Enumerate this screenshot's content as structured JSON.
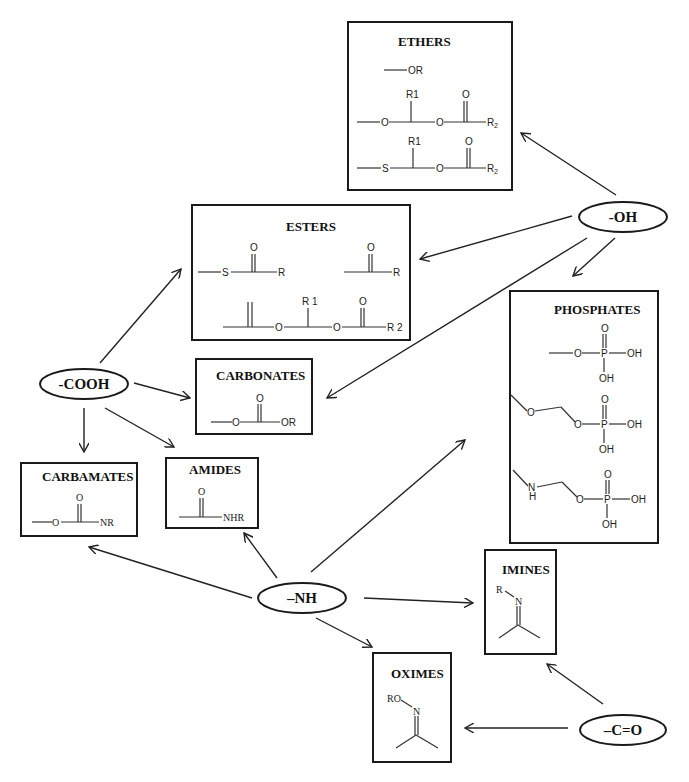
{
  "diagram": {
    "nodes": {
      "oh": {
        "label": "-OH"
      },
      "cooh": {
        "label": "-COOH"
      },
      "nh": {
        "label": "–NH"
      },
      "co": {
        "label": "–C=O"
      }
    },
    "groups": {
      "ethers": {
        "title": "ETHERS",
        "s1": {
          "or": "OR"
        },
        "s2": {
          "r1": "R1",
          "o1": "O",
          "o2": "O",
          "o3": "O",
          "r2": "R",
          "r2sub": "2"
        },
        "s3": {
          "r1": "R1",
          "s": "S",
          "o2": "O",
          "o3": "O",
          "r2": "R",
          "r2sub": "2"
        }
      },
      "esters": {
        "title": "ESTERS",
        "s1": {
          "s": "S",
          "o": "O",
          "r": "R"
        },
        "s2": {
          "o": "O",
          "r": "R"
        },
        "s3": {
          "r1": "R 1",
          "o1": "O",
          "o2": "O",
          "o3": "O",
          "r2": "R 2"
        }
      },
      "phosphates": {
        "title": "PHOSPHATES",
        "s1": {
          "o": "O",
          "p": "P",
          "od": "O",
          "oh1": "OH",
          "oh2": "OH"
        },
        "s2": {
          "o0": "O",
          "o": "O",
          "p": "P",
          "od": "O",
          "oh1": "OH",
          "oh2": "OH"
        },
        "s3": {
          "n": "N",
          "h": "H",
          "o": "O",
          "p": "P",
          "od": "O",
          "oh1": "OH",
          "oh2": "OH"
        }
      },
      "carbonates": {
        "title": "CARBONATES",
        "s1": {
          "o1": "O",
          "od": "O",
          "or": "OR"
        }
      },
      "carbamates": {
        "title": "CARBAMATES",
        "s1": {
          "o1": "O",
          "od": "O",
          "nr": "NR"
        }
      },
      "amides": {
        "title": "AMIDES",
        "s1": {
          "od": "O",
          "nhr": "NHR"
        }
      },
      "imines": {
        "title": "IMINES",
        "s1": {
          "r": "R",
          "n": "N"
        }
      },
      "oximes": {
        "title": "OXIMES",
        "s1": {
          "ro": "RO",
          "n": "N"
        }
      }
    },
    "edges": [
      {
        "from": "-OH",
        "to": "ETHERS"
      },
      {
        "from": "-OH",
        "to": "ESTERS"
      },
      {
        "from": "-OH",
        "to": "CARBONATES"
      },
      {
        "from": "-OH",
        "to": "PHOSPHATES"
      },
      {
        "from": "-COOH",
        "to": "ESTERS"
      },
      {
        "from": "-COOH",
        "to": "CARBONATES"
      },
      {
        "from": "-COOH",
        "to": "CARBAMATES"
      },
      {
        "from": "-COOH",
        "to": "AMIDES"
      },
      {
        "from": "–NH",
        "to": "CARBAMATES"
      },
      {
        "from": "–NH",
        "to": "AMIDES"
      },
      {
        "from": "–NH",
        "to": "PHOSPHATES"
      },
      {
        "from": "–NH",
        "to": "IMINES"
      },
      {
        "from": "–NH",
        "to": "OXIMES"
      },
      {
        "from": "–C=O",
        "to": "IMINES"
      },
      {
        "from": "–C=O",
        "to": "OXIMES"
      }
    ]
  }
}
